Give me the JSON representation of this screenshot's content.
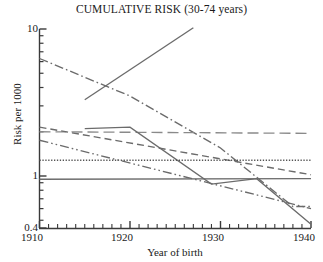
{
  "chart_data": {
    "type": "line",
    "title": "CUMULATIVE RISK (30-74 years)",
    "xlabel": "Year of birth",
    "ylabel": "Risk per 1000",
    "xlim": [
      1910,
      1940
    ],
    "ylim": [
      0.4,
      10
    ],
    "yscale": "log",
    "grid": false,
    "legend": "none",
    "xticks": [
      1910,
      1920,
      1930,
      1940
    ],
    "xtick_labels": [
      "1910",
      "1920",
      "1930",
      "1940"
    ],
    "xminor_tick_step": 1,
    "yticks": [
      10,
      1,
      0.4
    ],
    "ytick_labels": [
      "10",
      "1",
      "0.4"
    ],
    "series": [
      {
        "name": "rising-solid",
        "style": "solid",
        "color": "#6b6b6b",
        "x": [
          1915,
          1927
        ],
        "values": [
          3.3,
          10.2
        ]
      },
      {
        "name": "steep-dashdot",
        "style": "dash-dot",
        "color": "#6b6b6b",
        "x": [
          1910,
          1920,
          1930,
          1938,
          1940
        ],
        "values": [
          6.3,
          3.5,
          1.55,
          0.62,
          0.62
        ]
      },
      {
        "name": "flat-long-dash",
        "style": "long-dash",
        "color": "#8a8a8a",
        "x": [
          1910,
          1940
        ],
        "values": [
          2.0,
          1.95
        ]
      },
      {
        "name": "declining-dashed",
        "style": "dashed",
        "color": "#6b6b6b",
        "x": [
          1910,
          1940
        ],
        "values": [
          2.15,
          1.02
        ]
      },
      {
        "name": "plateau-solid",
        "style": "solid",
        "color": "#6b6b6b",
        "x": [
          1915,
          1920,
          1929,
          1934,
          1940
        ],
        "values": [
          2.1,
          2.15,
          0.88,
          0.96,
          0.47
        ]
      },
      {
        "name": "dotted-flat",
        "style": "dotted",
        "color": "#555555",
        "x": [
          1910,
          1940
        ],
        "values": [
          1.28,
          1.28
        ]
      },
      {
        "name": "declining-dash-dot-dot",
        "style": "dash-dot-dot",
        "color": "#6b6b6b",
        "x": [
          1910,
          1940
        ],
        "values": [
          1.75,
          0.6
        ]
      },
      {
        "name": "flat-solid-low",
        "style": "solid",
        "color": "#6b6b6b",
        "x": [
          1910,
          1940
        ],
        "values": [
          0.95,
          0.96
        ]
      }
    ]
  },
  "axes": {
    "title": "CUMULATIVE RISK (30-74 years)",
    "x_title": "Year of birth",
    "y_title": "Risk per 1000",
    "y_tick_top": "10",
    "y_tick_mid": "1",
    "y_tick_bottom": "0.4",
    "x_tick_1": "1910",
    "x_tick_2": "1920",
    "x_tick_3": "1930",
    "x_tick_4": "1940"
  }
}
